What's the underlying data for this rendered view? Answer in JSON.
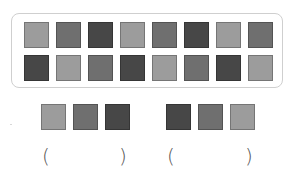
{
  "colors": {
    "light": "#9c9c9c",
    "medium": "#6f6f6f",
    "dark": "#474747",
    "frame_border": "#cfcfcf"
  },
  "pattern_box": {
    "rows": [
      [
        "light",
        "medium",
        "dark",
        "light",
        "medium",
        "dark",
        "light",
        "medium"
      ],
      [
        "dark",
        "light",
        "medium",
        "dark",
        "light",
        "medium",
        "dark",
        "light"
      ]
    ]
  },
  "answer_groups": [
    {
      "squares": [
        "light",
        "medium",
        "dark"
      ],
      "open_paren": "(",
      "close_paren": ")",
      "answer": ""
    },
    {
      "squares": [
        "dark",
        "medium",
        "light"
      ],
      "open_paren": "(",
      "close_paren": ")",
      "answer": ""
    }
  ]
}
